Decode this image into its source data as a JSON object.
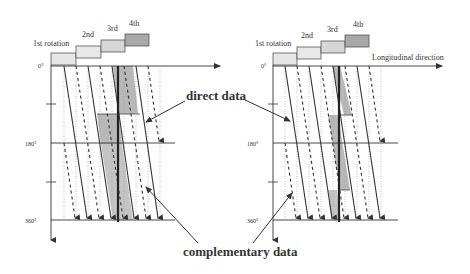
{
  "figure": {
    "left_panel": {
      "rotation_labels": [
        "1st rotation",
        "2nd",
        "3rd",
        "4th"
      ],
      "angle_ticks": [
        "0°",
        "180°",
        "360°"
      ]
    },
    "right_panel": {
      "rotation_labels": [
        "1st rotation",
        "2nd",
        "3rd",
        "4th"
      ],
      "angle_ticks": [
        "0°",
        "180°",
        "360°"
      ],
      "axis_label": "Longitudinal direction"
    },
    "annotations": {
      "direct": "direct data",
      "complementary": "complementary data"
    },
    "colors": {
      "box_light": "#e6e6e6",
      "box_mid": "#d0d0d0",
      "box_dark": "#a8a8a8",
      "shade": "#b8b8b8",
      "line": "#333333"
    }
  }
}
